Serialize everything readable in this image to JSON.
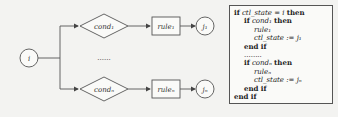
{
  "diagram": {
    "start_node": {
      "label": "i"
    },
    "branches": [
      {
        "condition": "cond₁",
        "rule": "rule₁",
        "target": "j₁"
      },
      {
        "condition": "condₙ",
        "rule": "ruleₙ",
        "target": "jₙ"
      }
    ],
    "ellipsis": "......"
  },
  "code": {
    "lines": [
      {
        "indent": 0,
        "kw1": "if",
        "text": "ctl_state = i",
        "kw2": "then"
      },
      {
        "indent": 1,
        "kw1": "if",
        "text": "cond₁",
        "kw2": "then"
      },
      {
        "indent": 2,
        "kw1": "",
        "text": "rule₁",
        "kw2": ""
      },
      {
        "indent": 2,
        "kw1": "",
        "text": "ctl_state := j₁",
        "kw2": ""
      },
      {
        "indent": 1,
        "kw1": "end if",
        "text": "",
        "kw2": ""
      },
      {
        "indent": 1,
        "kw1": "",
        "text": "........",
        "kw2": ""
      },
      {
        "indent": 1,
        "kw1": "if",
        "text": "condₙ",
        "kw2": "then"
      },
      {
        "indent": 2,
        "kw1": "",
        "text": "ruleₙ",
        "kw2": ""
      },
      {
        "indent": 2,
        "kw1": "",
        "text": "ctl_state := jₙ",
        "kw2": ""
      },
      {
        "indent": 1,
        "kw1": "end if",
        "text": "",
        "kw2": ""
      },
      {
        "indent": 0,
        "kw1": "end if",
        "text": "",
        "kw2": ""
      }
    ]
  }
}
